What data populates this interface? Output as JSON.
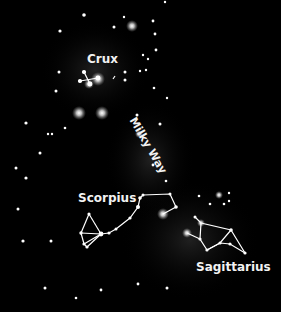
{
  "figure": {
    "background_color": "#000000",
    "star_color": "#ffffff",
    "line_color": "#ffffff",
    "labels": {
      "crux": "Crux",
      "milky_way": "Milky Way",
      "scorpius": "Scorpius",
      "sagittarius": "Sagittarius"
    }
  }
}
